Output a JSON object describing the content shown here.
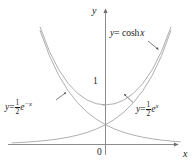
{
  "figure": {
    "name": "hyperbolic-cosine-graph",
    "background_color": "#ffffff",
    "curve_color": "#9a9a9a",
    "axis_color": "#8c8c8c",
    "text_color": "#1a1a1a"
  },
  "axes": {
    "y_label": "y",
    "x_label": "x",
    "origin_label": "0",
    "y_tick_label": "1"
  },
  "labels": {
    "cosh": {
      "lhs": "y",
      "eq": "= cosh",
      "arg": "x"
    },
    "half_exp_neg": {
      "lhs": "y",
      "eq": "=",
      "base": "e",
      "exponent": "−x",
      "num": "1",
      "den": "2"
    },
    "half_exp_pos": {
      "lhs": "y",
      "eq": "=",
      "base": "e",
      "exponent": "x",
      "num": "1",
      "den": "2"
    }
  },
  "chart_data": {
    "type": "line",
    "title": "",
    "xlabel": "x",
    "ylabel": "y",
    "xlim": [
      -2.55,
      2.0
    ],
    "ylim": [
      -0.28,
      3.6
    ],
    "grid": false,
    "legend": "inline-annotations",
    "annotations": [
      {
        "text": "y = cosh x",
        "target_series": "cosh x",
        "x": 1.15,
        "y": 2.75
      },
      {
        "text": "y = 1/2 e^-x",
        "target_series": "(1/2)e^-x",
        "x": -2.0,
        "y": 1.0
      },
      {
        "text": "y = 1/2 e^x",
        "target_series": "(1/2)e^x",
        "x": 0.85,
        "y": 0.92
      }
    ],
    "series": [
      {
        "name": "cosh x",
        "expression": "y = cosh x",
        "x": [
          -2.5,
          -2.25,
          -2.0,
          -1.75,
          -1.5,
          -1.25,
          -1.0,
          -0.75,
          -0.5,
          -0.25,
          0,
          0.25,
          0.5,
          0.75,
          1.0,
          1.25,
          1.5,
          1.75,
          2.0
        ],
        "values": [
          6.132,
          4.797,
          3.762,
          2.964,
          2.352,
          1.888,
          1.543,
          1.294,
          1.128,
          1.031,
          1.0,
          1.031,
          1.128,
          1.294,
          1.543,
          1.888,
          2.352,
          2.964,
          3.762
        ]
      },
      {
        "name": "(1/2)e^-x",
        "expression": "y = (1/2)e^{-x}",
        "x": [
          -2.5,
          -2.25,
          -2.0,
          -1.75,
          -1.5,
          -1.25,
          -1.0,
          -0.75,
          -0.5,
          -0.25,
          0,
          0.25,
          0.5,
          0.75,
          1.0,
          1.25,
          1.5,
          1.75,
          2.0
        ],
        "values": [
          6.091,
          4.745,
          3.695,
          2.877,
          2.241,
          1.745,
          1.359,
          1.058,
          0.824,
          0.642,
          0.5,
          0.389,
          0.303,
          0.236,
          0.184,
          0.143,
          0.112,
          0.087,
          0.068
        ]
      },
      {
        "name": "(1/2)e^x",
        "expression": "y = (1/2)e^{x}",
        "x": [
          -2.5,
          -2.25,
          -2.0,
          -1.75,
          -1.5,
          -1.25,
          -1.0,
          -0.75,
          -0.5,
          -0.25,
          0,
          0.25,
          0.5,
          0.75,
          1.0,
          1.25,
          1.5,
          1.75,
          2.0
        ],
        "values": [
          0.041,
          0.053,
          0.068,
          0.087,
          0.112,
          0.143,
          0.184,
          0.236,
          0.303,
          0.389,
          0.5,
          0.642,
          0.824,
          1.058,
          1.359,
          1.745,
          2.241,
          2.877,
          3.695
        ]
      }
    ],
    "key_points": [
      {
        "label": "cosh vertex",
        "x": 0,
        "y": 1
      },
      {
        "label": "exponentials intersect",
        "x": 0,
        "y": 0.5
      }
    ]
  }
}
